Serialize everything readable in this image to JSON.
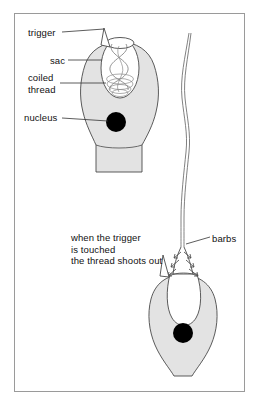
{
  "figure": {
    "frame_color": "#9a9a9a",
    "background": "#ffffff"
  },
  "colors": {
    "cytoplasm_fill": "#e3e3e3",
    "outline": "#4a4a4a",
    "nucleus": "#000000",
    "sac_fill": "#ffffff",
    "thread": "#6a6a6a",
    "leader_line": "#333333",
    "text": "#111111"
  },
  "labels": {
    "trigger": "trigger",
    "sac": "sac",
    "coiled_thread_line1": "coiled",
    "coiled_thread_line2": "thread",
    "nucleus": "nucleus",
    "barbs": "barbs"
  },
  "caption": {
    "line1": "when the trigger",
    "line2": "is touched",
    "line3": "the thread shoots out"
  },
  "parts": {
    "undischarged_cell": {
      "name": "undischarged-nematocyst",
      "has_trigger": true,
      "has_coiled_thread": true,
      "has_nucleus": true
    },
    "discharged_cell": {
      "name": "discharged-nematocyst",
      "has_everted_thread": true,
      "has_barbs": true,
      "has_nucleus": true
    }
  }
}
